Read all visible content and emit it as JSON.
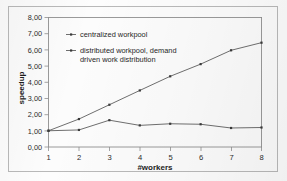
{
  "chart_data": {
    "type": "line",
    "title": "",
    "xlabel": "#workers",
    "ylabel": "speedup",
    "x": [
      1,
      2,
      3,
      4,
      5,
      6,
      7,
      8
    ],
    "xtick_labels": [
      "1",
      "2",
      "3",
      "4",
      "5",
      "6",
      "7",
      "8"
    ],
    "ytick_labels": [
      "0,00",
      "1,00",
      "2,00",
      "3,00",
      "4,00",
      "5,00",
      "6,00",
      "7,00",
      "8,00"
    ],
    "ytick_values": [
      0,
      1,
      2,
      3,
      4,
      5,
      6,
      7,
      8
    ],
    "ylim": [
      0,
      8
    ],
    "xlim": [
      1,
      8
    ],
    "grid": false,
    "legend_position": "upper-left-inside",
    "series": [
      {
        "name": "centralized workpool",
        "values": [
          1.0,
          1.05,
          1.65,
          1.33,
          1.43,
          1.4,
          1.17,
          1.2
        ]
      },
      {
        "name": "distributed workpool, demand driven work distribution",
        "values": [
          1.0,
          1.72,
          2.6,
          3.48,
          4.35,
          5.1,
          5.95,
          6.42
        ]
      }
    ]
  },
  "legend": {
    "entries": [
      {
        "label": "centralized workpool",
        "line2": ""
      },
      {
        "label": "distributed workpool, demand",
        "line2": "driven work distribution"
      }
    ]
  },
  "axes": {
    "y_title": "speedup",
    "x_title": "#workers"
  },
  "colors": {
    "line": "#555555",
    "marker": "#3a3a3a",
    "axis": "#8e8e8e",
    "frame": "#b9b9b9",
    "text": "#2b2b2b",
    "background": "#fcfcfc"
  }
}
